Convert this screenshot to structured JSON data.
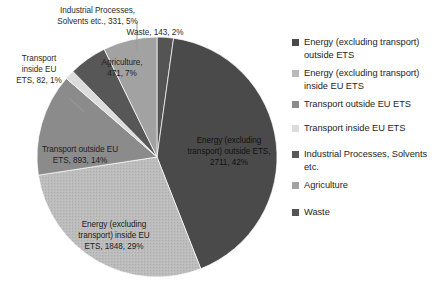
{
  "chart_data": {
    "type": "pie",
    "title": "",
    "unit_note": "",
    "legend_position": "right",
    "categories": [
      "Energy (excluding transport) outside ETS",
      "Energy (excluding transport) inside EU ETS",
      "Transport outside EU ETS",
      "Transport inside EU ETS",
      "Industrial Processes, Solvents etc.",
      "Agriculture",
      "Waste"
    ],
    "values": [
      2711,
      1848,
      893,
      82,
      331,
      471,
      143
    ],
    "percentages": [
      42,
      29,
      14,
      1,
      5,
      7,
      2
    ],
    "colors": [
      "#4a4a4a",
      "#b9b9b9",
      "#8b8b8b",
      "#dcdcdc",
      "#575757",
      "#a2a2a2",
      "#545454"
    ],
    "slices": [
      {
        "name": "Waste",
        "value": 143,
        "percent": 2,
        "color": "#545454",
        "start_angle": 0,
        "end_angle": 7.95,
        "label_text": "Waste, 143, 2%",
        "label_kind": "callout"
      },
      {
        "name": "Energy (excluding transport) outside ETS",
        "value": 2711,
        "percent": 42,
        "color": "#4a4a4a",
        "start_angle": 7.95,
        "end_angle": 158.6,
        "label_text": "Energy (excluding\ntransport) outside ETS,\n2711, 42%",
        "label_kind": "inside"
      },
      {
        "name": "Energy (excluding transport) inside EU ETS",
        "value": 1848,
        "percent": 29,
        "color": "#b9b9b9",
        "start_angle": 158.6,
        "end_angle": 261.3,
        "label_text": "Energy (excluding\ntransport) inside EU\nETS, 1848, 29%",
        "label_kind": "inside"
      },
      {
        "name": "Transport outside EU ETS",
        "value": 893,
        "percent": 14,
        "color": "#8b8b8b",
        "start_angle": 261.3,
        "end_angle": 310.9,
        "label_text": "Transport outside EU\nETS, 893, 14%",
        "label_kind": "inside"
      },
      {
        "name": "Transport inside EU ETS",
        "value": 82,
        "percent": 1,
        "color": "#dcdcdc",
        "start_angle": 310.9,
        "end_angle": 315.5,
        "label_text": "Transport\ninside EU\nETS, 82, 1%",
        "label_kind": "callout"
      },
      {
        "name": "Industrial Processes, Solvents etc.",
        "value": 331,
        "percent": 5,
        "color": "#575757",
        "start_angle": 315.5,
        "end_angle": 333.9,
        "label_text": "Industrial Processes,\nSolvents etc., 331, 5%",
        "label_kind": "callout"
      },
      {
        "name": "Agriculture",
        "value": 471,
        "percent": 7,
        "color": "#a2a2a2",
        "start_angle": 333.9,
        "end_angle": 360,
        "label_text": "Agriculture,\n471, 7%",
        "label_kind": "inside"
      }
    ]
  },
  "callouts": {
    "industrial": "Industrial Processes,\nSolvents etc., 331, 5%",
    "waste": "Waste, 143, 2%",
    "transport_inside": "Transport\ninside EU\nETS, 82, 1%"
  },
  "inside_labels": {
    "agriculture": "Agriculture,\n471, 7%",
    "energy_outside": "Energy (excluding\ntransport) outside ETS,\n2711, 42%",
    "energy_inside": "Energy (excluding\ntransport) inside EU\nETS, 1848, 29%",
    "transport_outside": "Transport outside EU\nETS, 893, 14%"
  },
  "legend": {
    "items": [
      {
        "label": "Energy (excluding transport) outside ETS",
        "color": "#4a4a4a",
        "top": 0
      },
      {
        "label": "Energy (excluding transport) inside EU ETS",
        "color": "#b9b9b9",
        "top": 31
      },
      {
        "label": "Transport outside EU ETS",
        "color": "#8b8b8b",
        "top": 62
      },
      {
        "label": "Transport inside EU ETS",
        "color": "#dcdcdc",
        "top": 86
      },
      {
        "label": "Industrial Processes, Solvents etc.",
        "color": "#575757",
        "top": 112
      },
      {
        "label": "Agriculture",
        "color": "#a2a2a2",
        "top": 143
      },
      {
        "label": "Waste",
        "color": "#545454",
        "top": 170
      }
    ]
  }
}
